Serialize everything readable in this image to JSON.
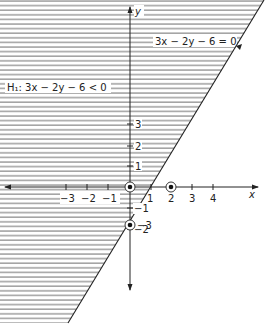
{
  "figure": {
    "inequality_label": "H₁: 3x − 2y − 6 < 0",
    "line_label": "3x − 2y − 6 = 0",
    "x_axis_label": "x",
    "y_axis_label": "y",
    "x_ticks": [
      {
        "value": -3,
        "label": "−3"
      },
      {
        "value": -2,
        "label": "−2"
      },
      {
        "value": -1,
        "label": "−1"
      },
      {
        "value": 1,
        "label": "1"
      },
      {
        "value": 2,
        "label": "2"
      },
      {
        "value": 3,
        "label": "3"
      },
      {
        "value": 4,
        "label": "4"
      }
    ],
    "y_ticks": [
      {
        "value": 3,
        "label": "3"
      },
      {
        "value": 2,
        "label": "2"
      },
      {
        "value": 1,
        "label": "1"
      },
      {
        "value": -1,
        "label": "−1"
      },
      {
        "value": -2,
        "label": "−2"
      },
      {
        "value": -3,
        "label": "−3"
      }
    ],
    "marked_points": [
      {
        "x": 0,
        "y": 0,
        "name": "origin"
      },
      {
        "x": 2,
        "y": 0,
        "name": "x-intercept"
      },
      {
        "x": 0,
        "y": -3,
        "name": "y-intercept"
      }
    ],
    "shaded_region": "half-plane left/above of line (3x - 2y - 6 < 0)",
    "colors": {
      "ink": "#222222",
      "hatch": "#555555",
      "background": "#ffffff"
    }
  }
}
